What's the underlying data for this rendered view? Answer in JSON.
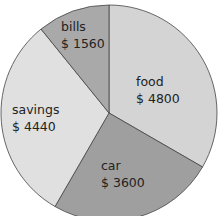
{
  "chart_data": {
    "type": "pie",
    "title": "",
    "categories": [
      "food",
      "car",
      "savings",
      "bills"
    ],
    "values": [
      4800,
      3600,
      4440,
      1560
    ],
    "value_labels": [
      "$ 4800",
      "$ 3600",
      "$ 4440",
      "$ 1560"
    ],
    "colors": [
      "#d4d4d4",
      "#9f9f9f",
      "#e0e0e0",
      "#a9a9a9"
    ],
    "start_angle_deg": 0,
    "direction": "clockwise"
  },
  "labels": {
    "food": {
      "name": "food",
      "value": "$ 4800"
    },
    "car": {
      "name": "car",
      "value": "$ 3600"
    },
    "savings": {
      "name": "savings",
      "value": "$ 4440"
    },
    "bills": {
      "name": "bills",
      "value": "$ 1560"
    }
  }
}
